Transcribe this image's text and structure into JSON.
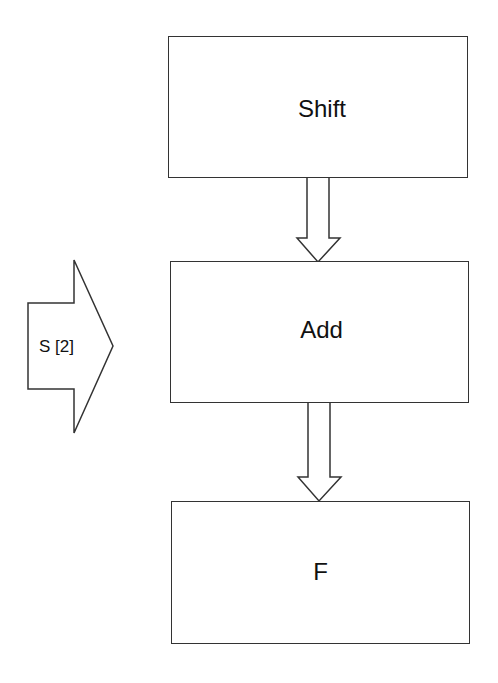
{
  "diagram": {
    "type": "flowchart",
    "nodes": [
      {
        "id": "shift",
        "label": "Shift"
      },
      {
        "id": "add",
        "label": "Add"
      },
      {
        "id": "f",
        "label": "F"
      }
    ],
    "edges": [
      {
        "from": "shift",
        "to": "add"
      },
      {
        "from": "add",
        "to": "f"
      }
    ],
    "side_input": {
      "label": "S [2]",
      "target": "add"
    }
  }
}
